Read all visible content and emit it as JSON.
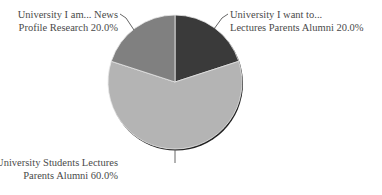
{
  "chart_data": {
    "type": "pie",
    "title": "",
    "start_angle_deg": 0,
    "direction": "clockwise",
    "slices": [
      {
        "label": "University I want to... Lectures Parents Alumni",
        "label_lines": [
          "University I want to...",
          "Lectures Parents Alumni 20.0%"
        ],
        "value": 20.0,
        "color": "#3a3a3a"
      },
      {
        "label": "University Students Lectures Parents Alumni",
        "label_lines": [
          "University Students Lectures",
          "Parents Alumni 60.0%"
        ],
        "value": 60.0,
        "color": "#b4b4b4"
      },
      {
        "label": "University I am... News Profile Research",
        "label_lines": [
          "University I am... News",
          "Profile Research 20.0%"
        ],
        "value": 20.0,
        "color": "#808080"
      }
    ],
    "categories": [
      "University I want to... Lectures Parents Alumni",
      "University Students Lectures Parents Alumni",
      "University I am... News Profile Research"
    ],
    "values": [
      20.0,
      60.0,
      20.0
    ],
    "value_format": "percent",
    "legend": "none",
    "label_position": "outside-with-leaders"
  }
}
